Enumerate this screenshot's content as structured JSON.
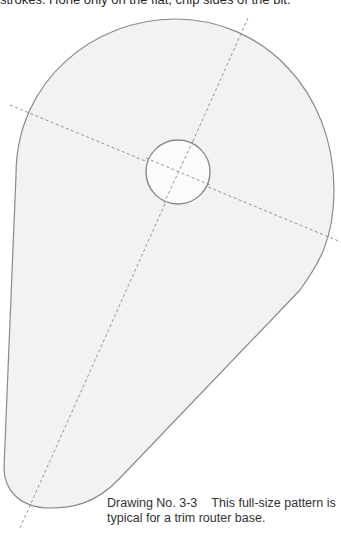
{
  "page": {
    "top_text": "strokes. Hone only on the flat, chip sides of the bit.",
    "caption": {
      "label": "Drawing No. 3-3",
      "line1": "This full-size pattern is",
      "line2": "typical for a trim router base."
    }
  },
  "drawing": {
    "type": "template-pattern",
    "shape": "teardrop router base outline",
    "fill_color": "#f2f2f2",
    "outline_color": "#8a8a8a",
    "centerline_color": "#8a8a8a",
    "center_hole": {
      "cx": 178,
      "cy": 172,
      "r": 32
    },
    "centerlines": [
      {
        "name": "horizontal-axis",
        "x1": 10,
        "y1": 105,
        "x2": 341,
        "y2": 242
      },
      {
        "name": "diagonal-axis",
        "x1": 248,
        "y1": 18,
        "x2": 20,
        "y2": 528
      }
    ]
  }
}
